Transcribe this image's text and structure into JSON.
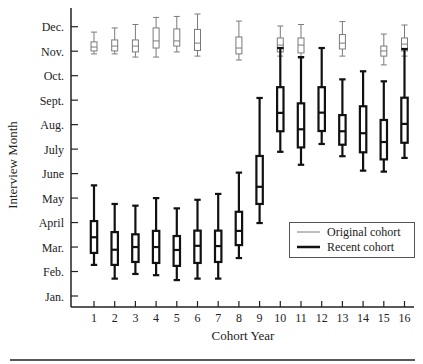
{
  "chart_data": {
    "type": "boxplot",
    "title": "",
    "xlabel": "Cohort Year",
    "ylabel": "Interview Month",
    "categories": [
      "1",
      "2",
      "3",
      "4",
      "5",
      "6",
      "7",
      "8",
      "9",
      "10",
      "11",
      "12",
      "13",
      "14",
      "15",
      "16"
    ],
    "y_ticks": [
      {
        "value": 1,
        "label": "Jan."
      },
      {
        "value": 2,
        "label": "Feb."
      },
      {
        "value": 3,
        "label": "Mar."
      },
      {
        "value": 4,
        "label": "April"
      },
      {
        "value": 5,
        "label": "May"
      },
      {
        "value": 6,
        "label": "June"
      },
      {
        "value": 7,
        "label": "July"
      },
      {
        "value": 8,
        "label": "Aug."
      },
      {
        "value": 9,
        "label": "Sept."
      },
      {
        "value": 10,
        "label": "Oct."
      },
      {
        "value": 11,
        "label": "Nov."
      },
      {
        "value": 12,
        "label": "Dec."
      }
    ],
    "ylim": [
      0.55,
      12.75
    ],
    "grid": false,
    "legend_position": "lower right inside",
    "series": [
      {
        "name": "Original cohort",
        "style": "thin",
        "color": "#7a7a7a",
        "boxes": [
          {
            "x": "1",
            "whisker_high": 11.78,
            "q3": 11.38,
            "median": 11.17,
            "q1": 11.01,
            "whisker_low": 10.89
          },
          {
            "x": "2",
            "whisker_high": 11.95,
            "q3": 11.46,
            "median": 11.21,
            "q1": 11.01,
            "whisker_low": 10.89
          },
          {
            "x": "3",
            "whisker_high": 12.09,
            "q3": 11.46,
            "median": 11.21,
            "q1": 10.97,
            "whisker_low": 10.76
          },
          {
            "x": "4",
            "whisker_high": 12.38,
            "q3": 11.95,
            "median": 11.42,
            "q1": 11.13,
            "whisker_low": 10.76
          },
          {
            "x": "5",
            "whisker_high": 12.42,
            "q3": 11.91,
            "median": 11.42,
            "q1": 11.21,
            "whisker_low": 10.97
          },
          {
            "x": "6",
            "whisker_high": 12.52,
            "q3": 11.89,
            "median": 11.33,
            "q1": 11.03,
            "whisker_low": 10.8
          },
          {
            "x": "8",
            "whisker_high": 12.23,
            "q3": 11.58,
            "median": 11.13,
            "q1": 10.89,
            "whisker_low": 10.64
          },
          {
            "x": "10",
            "whisker_high": 12.03,
            "q3": 11.54,
            "median": 11.25,
            "q1": 10.97,
            "whisker_low": 10.8
          },
          {
            "x": "11",
            "whisker_high": 12.09,
            "q3": 11.54,
            "median": 11.25,
            "q1": 10.93,
            "whisker_low": 10.72
          },
          {
            "x": "13",
            "whisker_high": 12.21,
            "q3": 11.68,
            "median": 11.33,
            "q1": 11.09,
            "whisker_low": 10.8
          },
          {
            "x": "15",
            "whisker_high": 11.7,
            "q3": 11.21,
            "median": 11.01,
            "q1": 10.8,
            "whisker_low": 10.44
          },
          {
            "x": "16",
            "whisker_high": 12.07,
            "q3": 11.54,
            "median": 11.29,
            "q1": 11.01,
            "whisker_low": 10.8
          }
        ]
      },
      {
        "name": "Recent cohort",
        "style": "thick",
        "color": "#111111",
        "boxes": [
          {
            "x": "1",
            "whisker_high": 5.52,
            "q3": 4.06,
            "median": 3.4,
            "q1": 2.76,
            "whisker_low": 2.27
          },
          {
            "x": "2",
            "whisker_high": 4.76,
            "q3": 3.61,
            "median": 2.89,
            "q1": 2.27,
            "whisker_low": 1.71
          },
          {
            "x": "3",
            "whisker_high": 4.69,
            "q3": 3.52,
            "median": 3.0,
            "q1": 2.39,
            "whisker_low": 1.9
          },
          {
            "x": "4",
            "whisker_high": 5.0,
            "q3": 3.66,
            "median": 3.0,
            "q1": 2.35,
            "whisker_low": 1.85
          },
          {
            "x": "5",
            "whisker_high": 4.58,
            "q3": 3.45,
            "median": 2.88,
            "q1": 2.23,
            "whisker_low": 1.65
          },
          {
            "x": "6",
            "whisker_high": 4.93,
            "q3": 3.67,
            "median": 3.05,
            "q1": 2.35,
            "whisker_low": 1.71
          },
          {
            "x": "7",
            "whisker_high": 5.17,
            "q3": 3.67,
            "median": 3.04,
            "q1": 2.39,
            "whisker_low": 1.71
          },
          {
            "x": "8",
            "whisker_high": 6.04,
            "q3": 4.44,
            "median": 3.66,
            "q1": 3.08,
            "whisker_low": 2.55
          },
          {
            "x": "9",
            "whisker_high": 9.09,
            "q3": 6.72,
            "median": 5.46,
            "q1": 4.76,
            "whisker_low": 3.98
          },
          {
            "x": "10",
            "whisker_high": 11.13,
            "q3": 9.53,
            "median": 8.48,
            "q1": 7.73,
            "whisker_low": 6.89
          },
          {
            "x": "11",
            "whisker_high": 10.76,
            "q3": 8.87,
            "median": 7.81,
            "q1": 7.07,
            "whisker_low": 6.36
          },
          {
            "x": "12",
            "whisker_high": 11.13,
            "q3": 9.53,
            "median": 8.49,
            "q1": 7.74,
            "whisker_low": 7.21
          },
          {
            "x": "13",
            "whisker_high": 9.85,
            "q3": 8.39,
            "median": 7.73,
            "q1": 7.18,
            "whisker_low": 6.71
          },
          {
            "x": "14",
            "whisker_high": 10.18,
            "q3": 8.75,
            "median": 7.65,
            "q1": 6.87,
            "whisker_low": 6.12
          },
          {
            "x": "15",
            "whisker_high": 9.77,
            "q3": 8.19,
            "median": 7.29,
            "q1": 6.58,
            "whisker_low": 6.08
          },
          {
            "x": "16",
            "whisker_high": 11.09,
            "q3": 9.1,
            "median": 8.03,
            "q1": 7.26,
            "whisker_low": 6.64
          }
        ]
      }
    ]
  },
  "legend": {
    "items": [
      {
        "label": "Original cohort",
        "style": "thin"
      },
      {
        "label": "Recent cohort",
        "style": "thick"
      }
    ]
  }
}
